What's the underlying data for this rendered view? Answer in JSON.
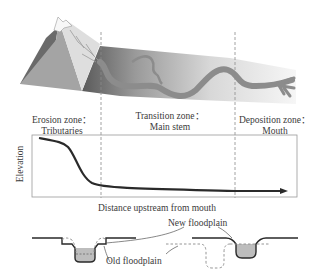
{
  "zones": [
    {
      "title": "Erosion zone：",
      "subtitle": "Tributaries"
    },
    {
      "title": "Transition zone：",
      "subtitle": "Main stem"
    },
    {
      "title": "Deposition zone：",
      "subtitle": "Mouth"
    }
  ],
  "profile_chart": {
    "ylabel": "Elevation",
    "xlabel": "Distance upstream from mouth"
  },
  "cross_section": {
    "new_floodplain_label": "New floodplain",
    "old_floodplain_label": "Old floodplain"
  },
  "colors": {
    "line": "#2a2a2a",
    "dashed": "#8a8a8a",
    "river": "#8c8c8c",
    "water": "#bdbdbd",
    "mountain_dark": "#6e6e6e",
    "mountain_mid": "#a6a6a6",
    "mountain_light": "#dcdcdc"
  }
}
